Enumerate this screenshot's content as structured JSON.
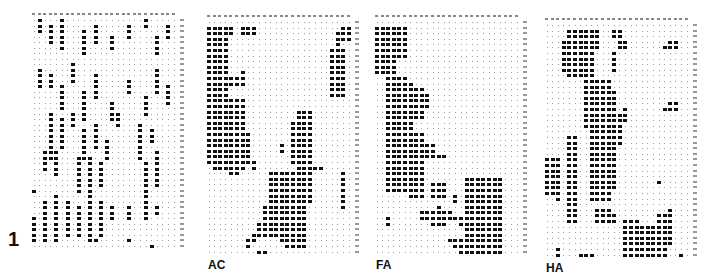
{
  "figure": {
    "number_label": "1",
    "panels": [
      {
        "id": "raw",
        "label": "",
        "x": 32,
        "y": 13,
        "cols": 26,
        "rows": 42,
        "cw": 5.6,
        "rh": 5.5,
        "pattern": "scatter",
        "seed": 7,
        "blocks": [
          [
            1,
            0,
            1,
            3
          ],
          [
            3,
            1,
            1,
            4
          ],
          [
            5,
            0,
            1,
            6
          ],
          [
            9,
            2,
            1,
            5
          ],
          [
            11,
            1,
            1,
            4
          ],
          [
            14,
            3,
            1,
            3
          ],
          [
            17,
            1,
            1,
            3
          ],
          [
            20,
            0,
            1,
            2
          ],
          [
            22,
            3,
            1,
            4
          ],
          [
            24,
            1,
            1,
            3
          ],
          [
            1,
            9,
            1,
            4
          ],
          [
            3,
            10,
            1,
            3
          ],
          [
            5,
            12,
            1,
            5
          ],
          [
            7,
            8,
            1,
            4
          ],
          [
            9,
            13,
            1,
            6
          ],
          [
            11,
            10,
            1,
            5
          ],
          [
            14,
            15,
            1,
            4
          ],
          [
            17,
            11,
            1,
            3
          ],
          [
            20,
            14,
            1,
            4
          ],
          [
            22,
            9,
            1,
            5
          ],
          [
            24,
            12,
            1,
            4
          ],
          [
            3,
            17,
            1,
            9
          ],
          [
            5,
            18,
            1,
            6
          ],
          [
            7,
            17,
            1,
            3
          ],
          [
            9,
            20,
            1,
            6
          ],
          [
            11,
            19,
            1,
            5
          ],
          [
            13,
            22,
            1,
            4
          ],
          [
            15,
            17,
            1,
            3
          ],
          [
            19,
            19,
            1,
            7
          ],
          [
            21,
            20,
            1,
            3
          ],
          [
            2,
            24,
            1,
            4
          ],
          [
            4,
            24,
            1,
            5
          ],
          [
            8,
            25,
            1,
            7
          ],
          [
            10,
            25,
            1,
            8
          ],
          [
            12,
            26,
            1,
            5
          ],
          [
            20,
            26,
            1,
            7
          ],
          [
            22,
            24,
            1,
            7
          ],
          [
            0,
            31,
            1,
            1
          ],
          [
            2,
            33,
            1,
            8
          ],
          [
            4,
            32,
            1,
            9
          ],
          [
            6,
            33,
            1,
            6
          ],
          [
            8,
            34,
            1,
            6
          ],
          [
            10,
            32,
            1,
            9
          ],
          [
            12,
            33,
            1,
            7
          ],
          [
            14,
            34,
            1,
            3
          ],
          [
            17,
            34,
            1,
            3
          ],
          [
            20,
            33,
            1,
            4
          ],
          [
            22,
            34,
            1,
            2
          ],
          [
            0,
            36,
            1,
            5
          ],
          [
            6,
            36,
            1,
            4
          ],
          [
            11,
            40,
            1,
            1
          ],
          [
            17,
            40,
            1,
            1
          ],
          [
            21,
            41,
            1,
            1
          ]
        ]
      },
      {
        "id": "AC",
        "label": "AC",
        "x": 207,
        "y": 15,
        "cols": 26,
        "rows": 42,
        "cw": 5.6,
        "rh": 5.6,
        "pattern": "blocks",
        "blocks": [
          [
            0,
            1,
            4,
            21
          ],
          [
            4,
            1,
            1,
            2
          ],
          [
            6,
            1,
            3,
            2
          ],
          [
            24,
            1,
            2,
            3
          ],
          [
            22,
            5,
            3,
            9
          ],
          [
            23,
            2,
            1,
            3
          ],
          [
            2,
            7,
            1,
            2
          ],
          [
            4,
            10,
            2,
            2
          ],
          [
            6,
            9,
            1,
            3
          ],
          [
            0,
            14,
            7,
            12
          ],
          [
            0,
            20,
            8,
            6
          ],
          [
            1,
            26,
            6,
            1
          ],
          [
            4,
            27,
            2,
            1
          ],
          [
            16,
            16,
            3,
            14
          ],
          [
            15,
            18,
            1,
            8
          ],
          [
            11,
            27,
            8,
            6
          ],
          [
            12,
            29,
            6,
            10
          ],
          [
            10,
            33,
            8,
            5
          ],
          [
            9,
            36,
            4,
            3
          ],
          [
            13,
            37,
            4,
            3
          ],
          [
            17,
            38,
            1,
            2
          ],
          [
            8,
            38,
            1,
            2
          ],
          [
            7,
            39,
            1,
            2
          ],
          [
            14,
            40,
            4,
            1
          ],
          [
            9,
            41,
            2,
            1
          ],
          [
            24,
            27,
            1,
            7
          ],
          [
            13,
            22,
            1,
            2
          ],
          [
            6,
            21,
            1,
            1
          ],
          [
            8,
            25,
            1,
            2
          ],
          [
            19,
            26,
            1,
            1
          ],
          [
            20,
            26,
            1,
            1
          ]
        ]
      },
      {
        "id": "FA",
        "label": "FA",
        "x": 375,
        "y": 15,
        "cols": 26,
        "rows": 42,
        "cw": 5.6,
        "rh": 5.6,
        "pattern": "blocks",
        "blocks": [
          [
            0,
            1,
            6,
            6
          ],
          [
            0,
            7,
            4,
            3
          ],
          [
            2,
            10,
            4,
            2
          ],
          [
            3,
            10,
            1,
            3
          ],
          [
            2,
            11,
            5,
            20
          ],
          [
            7,
            12,
            2,
            6
          ],
          [
            9,
            13,
            1,
            3
          ],
          [
            5,
            20,
            4,
            8
          ],
          [
            9,
            22,
            2,
            3
          ],
          [
            11,
            24,
            2,
            1
          ],
          [
            6,
            27,
            3,
            5
          ],
          [
            10,
            29,
            3,
            3
          ],
          [
            11,
            33,
            1,
            2
          ],
          [
            12,
            34,
            2,
            2
          ],
          [
            14,
            35,
            2,
            1
          ],
          [
            15,
            36,
            1,
            1
          ],
          [
            8,
            34,
            4,
            2
          ],
          [
            2,
            35,
            1,
            2
          ],
          [
            10,
            36,
            3,
            1
          ],
          [
            14,
            40,
            2,
            1
          ],
          [
            13,
            39,
            2,
            1
          ],
          [
            16,
            28,
            7,
            17
          ],
          [
            17,
            30,
            6,
            14
          ],
          [
            15,
            39,
            7,
            4
          ],
          [
            19,
            35,
            3,
            6
          ],
          [
            12,
            42,
            1,
            1
          ],
          [
            20,
            43,
            5,
            1
          ],
          [
            14,
            31,
            1,
            2
          ]
        ]
      },
      {
        "id": "HA",
        "label": "HA",
        "x": 545,
        "y": 18,
        "cols": 26,
        "rows": 42,
        "cw": 5.6,
        "rh": 5.6,
        "pattern": "blocks",
        "blocks": [
          [
            4,
            1,
            1,
            2
          ],
          [
            5,
            1,
            5,
            4
          ],
          [
            12,
            1,
            2,
            2
          ],
          [
            13,
            3,
            2,
            2
          ],
          [
            3,
            3,
            2,
            6
          ],
          [
            4,
            5,
            5,
            5
          ],
          [
            12,
            5,
            1,
            4
          ],
          [
            22,
            3,
            2,
            2
          ],
          [
            21,
            4,
            1,
            1
          ],
          [
            7,
            10,
            2,
            9
          ],
          [
            8,
            10,
            4,
            22
          ],
          [
            10,
            12,
            3,
            18
          ],
          [
            11,
            16,
            3,
            6
          ],
          [
            13,
            18,
            1,
            1
          ],
          [
            14,
            15,
            1,
            3
          ],
          [
            22,
            14,
            1,
            2
          ],
          [
            23,
            14,
            1,
            2
          ],
          [
            21,
            15,
            1,
            1
          ],
          [
            4,
            20,
            2,
            16
          ],
          [
            0,
            24,
            2,
            7
          ],
          [
            2,
            24,
            1,
            8
          ],
          [
            9,
            33,
            3,
            3
          ],
          [
            12,
            34,
            1,
            2
          ],
          [
            14,
            35,
            3,
            10
          ],
          [
            15,
            36,
            5,
            9
          ],
          [
            16,
            38,
            6,
            8
          ],
          [
            18,
            37,
            1,
            2
          ],
          [
            20,
            34,
            3,
            6
          ],
          [
            22,
            33,
            1,
            4
          ],
          [
            14,
            41,
            7,
            2
          ],
          [
            24,
            41,
            1,
            1
          ],
          [
            24,
            44,
            1,
            2
          ],
          [
            2,
            40,
            1,
            5
          ],
          [
            6,
            41,
            3,
            1
          ],
          [
            9,
            43,
            1,
            1
          ],
          [
            13,
            44,
            1,
            2
          ],
          [
            15,
            44,
            1,
            1
          ],
          [
            18,
            45,
            2,
            1
          ],
          [
            11,
            23,
            1,
            2
          ],
          [
            20,
            28,
            1,
            1
          ]
        ]
      }
    ]
  }
}
